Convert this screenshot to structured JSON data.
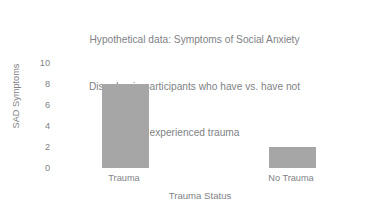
{
  "chart_data": {
    "type": "bar",
    "title": "Hypothetical data: Symptoms of Social Anxiety Disorder  in participants who have vs. have not experienced trauma",
    "title_lines": [
      "Hypothetical data: Symptoms of Social Anxiety",
      "Disorder  in participants who have vs. have not",
      "experienced trauma"
    ],
    "categories": [
      "Trauma",
      "No Trauma"
    ],
    "values": [
      8,
      2
    ],
    "xlabel": "Trauma Status",
    "ylabel": "SAD Symptoms",
    "ylim": [
      0,
      10
    ],
    "ytick_labels": [
      "10",
      "8",
      "6",
      "4",
      "2",
      "0"
    ],
    "ytick_values": [
      10,
      8,
      6,
      4,
      2,
      0
    ],
    "grid": false,
    "legend": false,
    "bar_color": "#a6a6a6",
    "text_color": "#808285",
    "background_color": "#ffffff"
  }
}
